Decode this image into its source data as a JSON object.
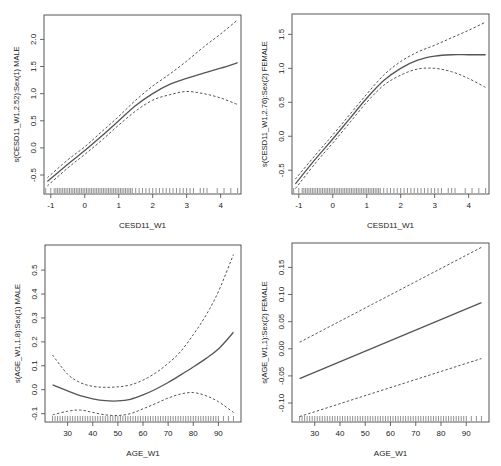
{
  "figure": {
    "width": 501,
    "height": 466,
    "line_color": "#555555",
    "ci_color": "#555555",
    "axis_color": "#444444",
    "rug_color": "#222222"
  },
  "chart_data": [
    {
      "type": "line",
      "id": "panel-cesd-male",
      "title": "",
      "xlabel": "CESD11_W1",
      "ylabel": "s(CESD11_W1,2.52):Sex(1) MALE",
      "xlim": [
        -1.2,
        4.6
      ],
      "ylim": [
        -0.85,
        2.45
      ],
      "xticks": [
        -1,
        0,
        1,
        2,
        3,
        4
      ],
      "xtick_labels": [
        "-1",
        "0",
        "1",
        "2",
        "3",
        "4"
      ],
      "yticks": [
        -0.5,
        0.0,
        0.5,
        1.0,
        1.5,
        2.0
      ],
      "ytick_labels": [
        "-0.5",
        "0.0",
        "0.5",
        "1.0",
        "1.5",
        "2.0"
      ],
      "box": {
        "left": 44,
        "top": 15,
        "right": 241,
        "bottom": 194
      },
      "x": [
        -1.1,
        -0.5,
        0.0,
        0.5,
        1.0,
        1.5,
        2.0,
        2.5,
        3.0,
        3.5,
        4.0,
        4.5
      ],
      "series": [
        {
          "name": "fit",
          "style": "solid",
          "values": [
            -0.62,
            -0.3,
            -0.05,
            0.22,
            0.5,
            0.78,
            1.0,
            1.17,
            1.28,
            1.38,
            1.47,
            1.57
          ]
        },
        {
          "name": "upper_ci",
          "style": "dashed",
          "values": [
            -0.55,
            -0.22,
            0.02,
            0.3,
            0.58,
            0.88,
            1.14,
            1.36,
            1.6,
            1.86,
            2.1,
            2.36
          ]
        },
        {
          "name": "lower_ci",
          "style": "dashed",
          "values": [
            -0.7,
            -0.37,
            -0.12,
            0.14,
            0.42,
            0.68,
            0.88,
            0.98,
            1.04,
            1.0,
            0.92,
            0.8
          ]
        }
      ],
      "rug": [
        -1.15,
        -1.0,
        -0.9,
        -0.85,
        -0.8,
        -0.75,
        -0.7,
        -0.65,
        -0.6,
        -0.55,
        -0.5,
        -0.45,
        -0.4,
        -0.35,
        -0.3,
        -0.25,
        -0.2,
        -0.15,
        -0.1,
        -0.05,
        0.0,
        0.05,
        0.1,
        0.15,
        0.2,
        0.25,
        0.3,
        0.35,
        0.4,
        0.45,
        0.5,
        0.55,
        0.6,
        0.65,
        0.7,
        0.75,
        0.8,
        0.85,
        0.9,
        0.95,
        1.0,
        1.05,
        1.1,
        1.15,
        1.2,
        1.25,
        1.3,
        1.35,
        1.4,
        1.5,
        1.6,
        1.7,
        1.8,
        1.9,
        2.0,
        2.1,
        2.2,
        2.3,
        2.4,
        2.5,
        2.6,
        2.7,
        2.8,
        2.9,
        3.0,
        3.1,
        3.2,
        3.4,
        3.5,
        3.6,
        3.9,
        4.1,
        4.3,
        4.5
      ]
    },
    {
      "type": "line",
      "id": "panel-cesd-female",
      "title": "",
      "xlabel": "CESD11_W1",
      "ylabel": "s(CESD11_W1,2.76):Sex(2) FEMALE",
      "xlim": [
        -1.2,
        4.6
      ],
      "ylim": [
        -0.85,
        1.8
      ],
      "xticks": [
        -1,
        0,
        1,
        2,
        3,
        4
      ],
      "xtick_labels": [
        "-1",
        "0",
        "1",
        "2",
        "3",
        "4"
      ],
      "yticks": [
        -0.5,
        0.0,
        0.5,
        1.0,
        1.5
      ],
      "ytick_labels": [
        "-0.5",
        "0.0",
        "0.5",
        "1.0",
        "1.5"
      ],
      "box": {
        "left": 292,
        "top": 14,
        "right": 489,
        "bottom": 194
      },
      "x": [
        -1.1,
        -0.5,
        0.0,
        0.5,
        1.0,
        1.5,
        2.0,
        2.5,
        3.0,
        3.5,
        4.0,
        4.5
      ],
      "series": [
        {
          "name": "fit",
          "style": "solid",
          "values": [
            -0.7,
            -0.33,
            -0.04,
            0.26,
            0.56,
            0.82,
            1.0,
            1.12,
            1.18,
            1.2,
            1.2,
            1.2
          ]
        },
        {
          "name": "upper_ci",
          "style": "dashed",
          "values": [
            -0.63,
            -0.27,
            0.02,
            0.32,
            0.62,
            0.9,
            1.1,
            1.24,
            1.34,
            1.45,
            1.56,
            1.68
          ]
        },
        {
          "name": "lower_ci",
          "style": "dashed",
          "values": [
            -0.77,
            -0.39,
            -0.1,
            0.2,
            0.5,
            0.75,
            0.9,
            0.99,
            1.0,
            0.95,
            0.85,
            0.72
          ]
        }
      ],
      "rug": [
        -1.15,
        -1.0,
        -0.9,
        -0.85,
        -0.8,
        -0.75,
        -0.7,
        -0.65,
        -0.6,
        -0.55,
        -0.5,
        -0.45,
        -0.4,
        -0.35,
        -0.3,
        -0.25,
        -0.2,
        -0.15,
        -0.1,
        -0.05,
        0.0,
        0.05,
        0.1,
        0.15,
        0.2,
        0.25,
        0.3,
        0.35,
        0.4,
        0.45,
        0.5,
        0.55,
        0.6,
        0.65,
        0.7,
        0.75,
        0.8,
        0.85,
        0.9,
        0.95,
        1.0,
        1.05,
        1.1,
        1.15,
        1.2,
        1.25,
        1.3,
        1.35,
        1.4,
        1.5,
        1.6,
        1.7,
        1.8,
        1.9,
        2.0,
        2.1,
        2.2,
        2.3,
        2.4,
        2.5,
        2.6,
        2.7,
        2.8,
        2.9,
        3.0,
        3.1,
        3.2,
        3.4,
        3.5,
        3.6,
        3.9,
        4.1,
        4.3,
        4.5
      ]
    },
    {
      "type": "line",
      "id": "panel-age-male",
      "title": "",
      "xlabel": "AGE_W1",
      "ylabel": "s(AGE_W1,1.8):Sex(1) MALE",
      "xlim": [
        21,
        99
      ],
      "ylim": [
        -0.135,
        0.605
      ],
      "xticks": [
        30,
        40,
        50,
        60,
        70,
        80,
        90
      ],
      "xtick_labels": [
        "30",
        "40",
        "50",
        "60",
        "70",
        "80",
        "90"
      ],
      "yticks": [
        -0.1,
        0.0,
        0.1,
        0.2,
        0.3,
        0.4,
        0.5
      ],
      "ytick_labels": [
        "-0.1",
        "0.0",
        "0.1",
        "0.2",
        "0.3",
        "0.4",
        "0.5"
      ],
      "box": {
        "left": 45,
        "top": 245,
        "right": 241,
        "bottom": 422
      },
      "x": [
        24,
        30,
        35,
        40,
        45,
        50,
        55,
        60,
        65,
        70,
        75,
        80,
        85,
        90,
        96
      ],
      "series": [
        {
          "name": "fit",
          "style": "solid",
          "values": [
            0.02,
            -0.005,
            -0.025,
            -0.038,
            -0.046,
            -0.047,
            -0.04,
            -0.022,
            0.002,
            0.03,
            0.062,
            0.095,
            0.13,
            0.17,
            0.24
          ]
        },
        {
          "name": "upper_ci",
          "style": "dashed",
          "values": [
            0.145,
            0.065,
            0.03,
            0.014,
            0.01,
            0.012,
            0.02,
            0.04,
            0.07,
            0.11,
            0.16,
            0.23,
            0.31,
            0.41,
            0.565
          ]
        },
        {
          "name": "lower_ci",
          "style": "dashed",
          "values": [
            -0.105,
            -0.09,
            -0.085,
            -0.095,
            -0.105,
            -0.108,
            -0.1,
            -0.08,
            -0.058,
            -0.035,
            -0.018,
            -0.012,
            -0.025,
            -0.05,
            -0.095
          ]
        }
      ],
      "rug": [
        24,
        25,
        26,
        27,
        28,
        29,
        30,
        31,
        32,
        33,
        34,
        35,
        36,
        37,
        38,
        39,
        40,
        41,
        42,
        43,
        44,
        45,
        46,
        47,
        48,
        49,
        50,
        51,
        52,
        53,
        54,
        55,
        56,
        57,
        58,
        59,
        60,
        61,
        62,
        63,
        64,
        65,
        66,
        67,
        68,
        69,
        70,
        71,
        72,
        73,
        74,
        75,
        76,
        77,
        78,
        79,
        80,
        81,
        82,
        83,
        84,
        85,
        86,
        87,
        88,
        89,
        90,
        92,
        94,
        96
      ]
    },
    {
      "type": "line",
      "id": "panel-age-female",
      "title": "",
      "xlabel": "AGE_W1",
      "ylabel": "s(AGE_W1,1):Sex(2) FEMALE",
      "xlim": [
        21,
        99
      ],
      "ylim": [
        -0.135,
        0.195
      ],
      "xticks": [
        30,
        40,
        50,
        60,
        70,
        80,
        90
      ],
      "xtick_labels": [
        "30",
        "40",
        "50",
        "60",
        "70",
        "80",
        "90"
      ],
      "yticks": [
        -0.1,
        -0.05,
        0.0,
        0.05,
        0.1,
        0.15
      ],
      "ytick_labels": [
        "-0.10",
        "-0.05",
        "0.00",
        "0.05",
        "0.10",
        "0.15"
      ],
      "box": {
        "left": 292,
        "top": 243,
        "right": 489,
        "bottom": 422
      },
      "x": [
        24,
        96
      ],
      "series": [
        {
          "name": "fit",
          "style": "solid",
          "values": [
            -0.055,
            0.085
          ]
        },
        {
          "name": "upper_ci",
          "style": "dashed",
          "values": [
            0.012,
            0.187
          ]
        },
        {
          "name": "lower_ci",
          "style": "dashed",
          "values": [
            -0.125,
            -0.018
          ]
        }
      ],
      "rug": [
        24,
        25,
        26,
        27,
        28,
        29,
        30,
        31,
        32,
        33,
        34,
        35,
        36,
        37,
        38,
        39,
        40,
        41,
        42,
        43,
        44,
        45,
        46,
        47,
        48,
        49,
        50,
        51,
        52,
        53,
        54,
        55,
        56,
        57,
        58,
        59,
        60,
        61,
        62,
        63,
        64,
        65,
        66,
        67,
        68,
        69,
        70,
        71,
        72,
        73,
        74,
        75,
        76,
        77,
        78,
        79,
        80,
        81,
        82,
        83,
        84,
        85,
        86,
        87,
        88,
        89,
        90,
        92,
        94,
        96
      ]
    }
  ]
}
